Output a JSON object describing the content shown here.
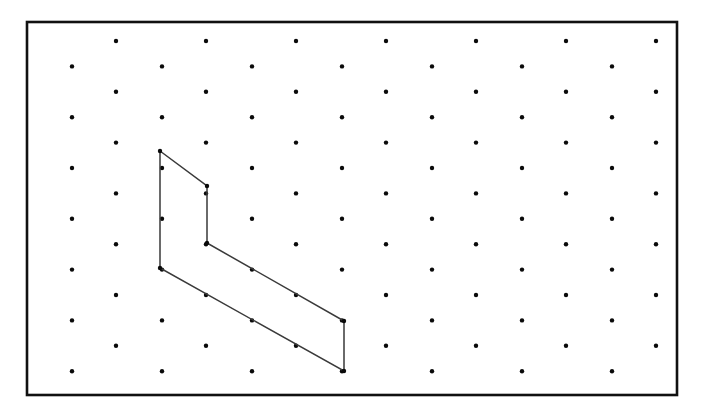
{
  "figure": {
    "background_color": "#ffffff",
    "canvas": {
      "width": 704,
      "height": 413
    }
  },
  "frame": {
    "name": "rectangular-border",
    "x": 27,
    "y": 22,
    "width": 650,
    "height": 373,
    "stroke_color": "#111111",
    "stroke_width": 2.6,
    "fill": "none"
  },
  "lattice": {
    "description": "staggered triangular dot lattice, alternating row x-offset",
    "dot_color": "#0a0a0a",
    "dot_radius": 2.2,
    "row_spacing": 25.4,
    "column_spacing": 90,
    "odd_row_offset_x": 72,
    "even_row_offset_x": 116,
    "first_row_y": 41,
    "row_count": 15,
    "points": [
      {
        "row": 0,
        "y": 41,
        "xs": [
          116,
          206,
          296,
          386,
          476,
          566,
          656
        ]
      },
      {
        "row": 1,
        "y": 66.4,
        "xs": [
          72,
          162,
          252,
          342,
          432,
          522,
          612
        ]
      },
      {
        "row": 2,
        "y": 91.8,
        "xs": [
          116,
          206,
          296,
          386,
          476,
          566,
          656
        ]
      },
      {
        "row": 3,
        "y": 117.2,
        "xs": [
          72,
          162,
          252,
          342,
          432,
          522,
          612
        ]
      },
      {
        "row": 4,
        "y": 142.6,
        "xs": [
          116,
          206,
          296,
          386,
          476,
          566,
          656
        ]
      },
      {
        "row": 5,
        "y": 168.0,
        "xs": [
          72,
          162,
          252,
          342,
          432,
          522,
          612
        ]
      },
      {
        "row": 6,
        "y": 193.4,
        "xs": [
          116,
          206,
          296,
          386,
          476,
          566,
          656
        ]
      },
      {
        "row": 7,
        "y": 218.8,
        "xs": [
          72,
          162,
          252,
          342,
          432,
          522,
          612
        ]
      },
      {
        "row": 8,
        "y": 244.2,
        "xs": [
          116,
          206,
          296,
          386,
          476,
          566,
          656
        ]
      },
      {
        "row": 9,
        "y": 269.6,
        "xs": [
          72,
          162,
          252,
          342,
          432,
          522,
          612
        ]
      },
      {
        "row": 10,
        "y": 295.0,
        "xs": [
          116,
          206,
          296,
          386,
          476,
          566,
          656
        ]
      },
      {
        "row": 11,
        "y": 320.4,
        "xs": [
          72,
          162,
          252,
          342,
          432,
          522,
          612
        ]
      },
      {
        "row": 12,
        "y": 345.8,
        "xs": [
          116,
          206,
          296,
          386,
          476,
          566,
          656
        ]
      },
      {
        "row": 13,
        "y": 371.2,
        "xs": [
          72,
          162,
          252,
          342,
          432,
          522,
          612
        ]
      }
    ]
  },
  "polygon": {
    "name": "hexagonal-polygon",
    "stroke_color": "#3a3a3a",
    "stroke_width": 1.5,
    "fill": "none",
    "closed": true,
    "vertex_count": 6,
    "vertices": [
      {
        "label": "A",
        "x": 160,
        "y": 151
      },
      {
        "label": "B",
        "x": 207,
        "y": 186
      },
      {
        "label": "C",
        "x": 207,
        "y": 243
      },
      {
        "label": "D",
        "x": 344,
        "y": 321
      },
      {
        "label": "E",
        "x": 344,
        "y": 371
      },
      {
        "label": "F",
        "x": 160,
        "y": 268
      }
    ],
    "edges": [
      {
        "from": "A",
        "to": "B",
        "type": "diagonal"
      },
      {
        "from": "B",
        "to": "C",
        "type": "vertical"
      },
      {
        "from": "C",
        "to": "D",
        "type": "diagonal"
      },
      {
        "from": "D",
        "to": "E",
        "type": "vertical"
      },
      {
        "from": "E",
        "to": "F",
        "type": "diagonal"
      },
      {
        "from": "F",
        "to": "A",
        "type": "vertical"
      }
    ]
  },
  "chart_data": {
    "type": "scatter",
    "xlabel": "",
    "ylabel": "",
    "xlim": [
      27,
      677
    ],
    "ylim": [
      22,
      395
    ],
    "grid": false,
    "legend": null,
    "series": [
      {
        "name": "lattice-dots",
        "marker": "dot",
        "color": "#0a0a0a",
        "count": 98
      },
      {
        "name": "polygon-outline",
        "marker": "line",
        "color": "#3a3a3a",
        "x": [
          160,
          207,
          207,
          344,
          344,
          160,
          160
        ],
        "y": [
          151,
          186,
          243,
          321,
          371,
          268,
          151
        ]
      }
    ]
  }
}
